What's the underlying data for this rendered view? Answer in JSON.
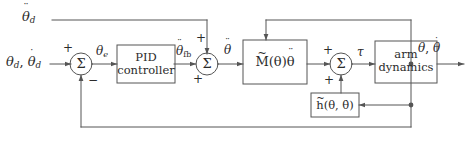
{
  "diagram": {
    "type": "control-block-diagram",
    "background_color": "#ffffff",
    "line_color": "#555555",
    "text_color": "#2b2b2b",
    "width": 470,
    "height": 149
  },
  "signals": {
    "feedforward_accel": "θ̈",
    "feedforward_accel_sub": "d",
    "reference_input": "θ",
    "reference_input_sub": "d",
    "reference_input_rate": "θ̇",
    "reference_input_rate_sub": "d",
    "reference_separator": ",",
    "error": "θ",
    "error_sub": "e",
    "pid_output": "θ̈",
    "pid_output_sub": "fb",
    "commanded_accel": "θ̈",
    "torque": "τ",
    "output_position": "θ",
    "output_separator": ",",
    "output_velocity": "θ̇"
  },
  "blocks": [
    {
      "id": "pid-controller",
      "line1": "PID",
      "line2": "controller"
    },
    {
      "id": "inertia-model",
      "symbol": "M",
      "accent": "~",
      "args": "(θ)",
      "operand": "θ̈"
    },
    {
      "id": "arm-dynamics",
      "line1": "arm",
      "line2": "dynamics"
    },
    {
      "id": "nonlinear-model",
      "symbol": "h",
      "accent": "~",
      "args": "(θ, θ̇)"
    }
  ],
  "summing_junctions": [
    {
      "id": "error-summer",
      "glyph": "Σ",
      "sign_top": "+",
      "sign_bottom": "−"
    },
    {
      "id": "accel-summer",
      "glyph": "Σ",
      "sign_top": "+",
      "sign_bottom": "+"
    },
    {
      "id": "torque-summer",
      "glyph": "Σ",
      "sign_top": "+",
      "sign_bottom": "+"
    }
  ]
}
